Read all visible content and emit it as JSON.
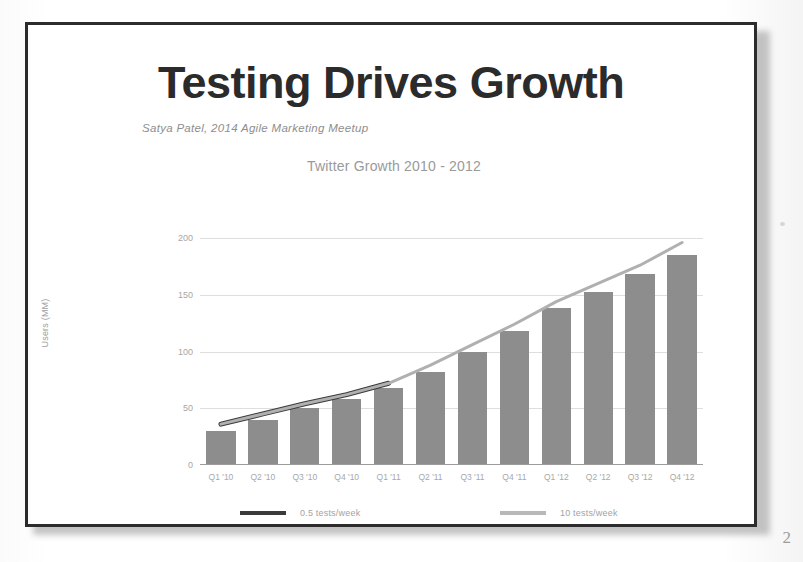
{
  "slide": {
    "title": "Testing Drives Growth",
    "subtitle": "Satya Patel, 2014 Agile Marketing Meetup",
    "page_mark": "2"
  },
  "chart_data": {
    "type": "bar",
    "title": "Twitter Growth 2010 - 2012",
    "xlabel": "",
    "ylabel": "Users (MM)",
    "ylim": [
      0,
      200
    ],
    "yticks": [
      "0",
      "50",
      "100",
      "150",
      "200"
    ],
    "ytick_values": [
      0,
      50,
      100,
      150,
      200
    ],
    "grid": true,
    "legend_position": "bottom",
    "categories": [
      "Q1 '10",
      "Q2 '10",
      "Q3 '10",
      "Q4 '10",
      "Q1 '11",
      "Q2 '11",
      "Q3 '11",
      "Q4 '11",
      "Q1 '12",
      "Q2 '12",
      "Q3 '12",
      "Q4 '12"
    ],
    "series": [
      {
        "name": "Users (MM)",
        "type": "bar",
        "color": "#8d8d8d",
        "values": [
          30,
          40,
          50,
          58,
          68,
          82,
          100,
          118,
          138,
          152,
          168,
          185
        ]
      },
      {
        "name": "0.5 tests/week",
        "type": "line",
        "color": "#3a3a3a",
        "x": [
          "Q1 '10",
          "Q2 '10",
          "Q3 '10",
          "Q4 '10",
          "Q1 '11"
        ],
        "values": [
          36,
          45,
          54,
          62,
          72
        ]
      },
      {
        "name": "10 tests/week",
        "type": "line",
        "color": "#b0b0b0",
        "x": [
          "Q1 '10",
          "Q2 '10",
          "Q3 '10",
          "Q4 '10",
          "Q1 '11",
          "Q2 '11",
          "Q3 '11",
          "Q4 '11",
          "Q1 '12",
          "Q2 '12",
          "Q3 '12",
          "Q4 '12"
        ],
        "values": [
          36,
          45,
          54,
          62,
          72,
          88,
          106,
          124,
          144,
          160,
          176,
          196
        ]
      }
    ],
    "legend": [
      {
        "label": "0.5 tests/week",
        "color": "#3a3a3a"
      },
      {
        "label": "10 tests/week",
        "color": "#b8b8b8"
      }
    ]
  }
}
